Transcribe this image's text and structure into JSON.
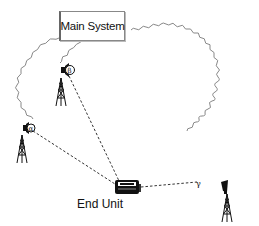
{
  "diagram": {
    "main_system": {
      "label": "Main System"
    },
    "end_unit": {
      "label": "End Unit"
    },
    "towers": [
      {
        "id": "tower-top",
        "angle_label": "β"
      },
      {
        "id": "tower-left",
        "angle_label": "α"
      },
      {
        "id": "tower-right",
        "angle_label": "γ"
      }
    ],
    "connections": {
      "wired": "wavy lines from Main System to each tower",
      "wireless": "dashed lines from each tower to End Unit"
    },
    "colors": {
      "wavy_line": "#888888",
      "dashed_line": "#333333",
      "ink": "#111111"
    }
  }
}
